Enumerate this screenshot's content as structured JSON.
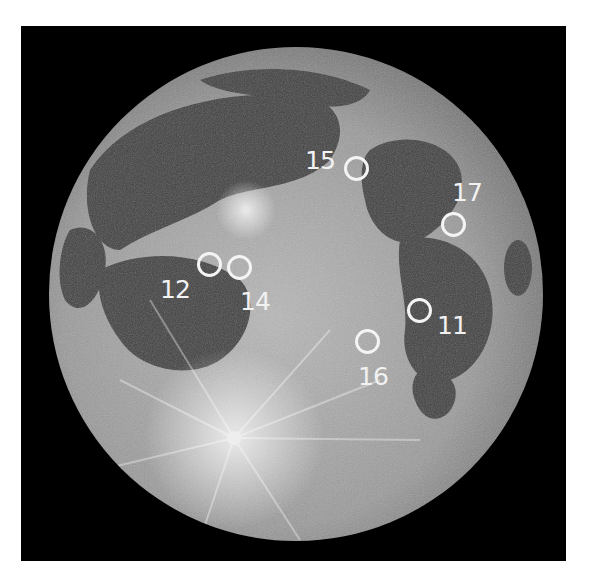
{
  "image": {
    "subject": "Full Moon (near side) with Apollo landing sites marked",
    "background_color": "#000000",
    "marker_color": "#f4f4f4"
  },
  "sites": [
    {
      "label": "11",
      "x": 419,
      "y": 310,
      "label_x": 437,
      "label_y": 313
    },
    {
      "label": "12",
      "x": 209,
      "y": 264,
      "label_x": 160,
      "label_y": 277
    },
    {
      "label": "14",
      "x": 239,
      "y": 267,
      "label_x": 240,
      "label_y": 289
    },
    {
      "label": "15",
      "x": 356,
      "y": 168,
      "label_x": 305,
      "label_y": 148
    },
    {
      "label": "16",
      "x": 367,
      "y": 341,
      "label_x": 358,
      "label_y": 364
    },
    {
      "label": "17",
      "x": 453,
      "y": 224,
      "label_x": 452,
      "label_y": 180
    }
  ]
}
